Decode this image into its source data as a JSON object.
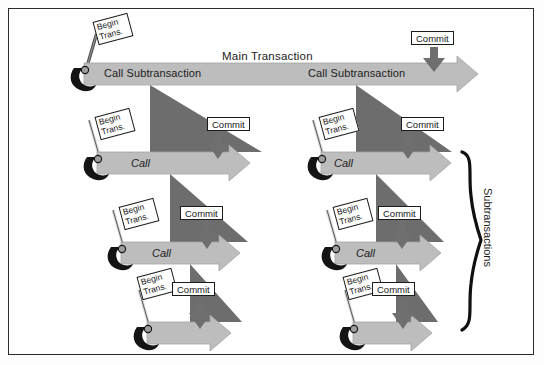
{
  "diagram": {
    "title_main": "Main Transaction",
    "side_label": "Subtransactions",
    "labels": {
      "begin": "Begin\nTrans.",
      "begin_line1": "Begin",
      "begin_line2": "Trans.",
      "commit": "Commit",
      "call_subtransaction": "Call Subtransaction",
      "call": "Call"
    },
    "colors": {
      "bar_fill": "#b9b9b9",
      "bar_edge": "#9a9a9a",
      "triangle_fill": "#6d6d6d",
      "hook_fill": "#161616",
      "frame": "#2a2a2a",
      "text": "#1c1c1c",
      "box_bg": "#ffffff",
      "arrow_head": "#c3c3c3"
    },
    "rows": [
      {
        "level": 0,
        "name": "main-transaction",
        "bar_label": "",
        "top_label": "Main Transaction",
        "inner_labels": [
          "Call Subtransaction",
          "Call Subtransaction"
        ],
        "has_begin_flag": true,
        "has_commit": true,
        "commit_label": "Commit"
      },
      {
        "level": 1,
        "name": "subtransaction-level-1-left",
        "bar_label": "Call",
        "has_begin_flag": true,
        "has_commit": true,
        "commit_label": "Commit"
      },
      {
        "level": 1,
        "name": "subtransaction-level-1-right",
        "bar_label": "Call",
        "has_begin_flag": true,
        "has_commit": true,
        "commit_label": "Commit"
      },
      {
        "level": 2,
        "name": "subtransaction-level-2-left",
        "bar_label": "Call",
        "has_begin_flag": true,
        "has_commit": true,
        "commit_label": "Commit"
      },
      {
        "level": 2,
        "name": "subtransaction-level-2-right",
        "bar_label": "Call",
        "has_begin_flag": true,
        "has_commit": true,
        "commit_label": "Commit"
      },
      {
        "level": 3,
        "name": "subtransaction-level-3-left",
        "bar_label": "",
        "has_begin_flag": true,
        "has_commit": true,
        "commit_label": "Commit"
      },
      {
        "level": 3,
        "name": "subtransaction-level-3-right",
        "bar_label": "",
        "has_begin_flag": true,
        "has_commit": true,
        "commit_label": "Commit"
      }
    ]
  }
}
